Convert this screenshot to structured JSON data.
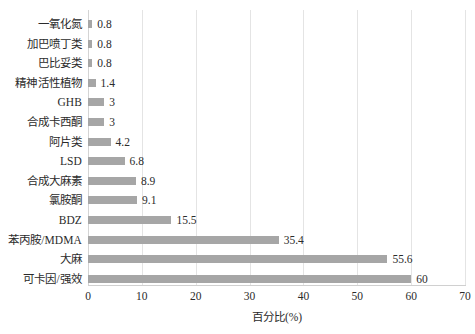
{
  "chart_data": {
    "type": "bar",
    "orientation": "horizontal",
    "title": "",
    "xlabel": "百分比(%)",
    "ylabel": "",
    "xlim": [
      0,
      70
    ],
    "xticks": [
      "0",
      "10",
      "20",
      "30",
      "40",
      "50",
      "60",
      "70"
    ],
    "grid": "vertical",
    "legend": "none",
    "bar_color": "#a6a6a6",
    "categories": [
      "一氧化氮",
      "加巴喷丁类",
      "巴比妥类",
      "精神活性植物",
      "GHB",
      "合成卡西酮",
      "阿片类",
      "LSD",
      "合成大麻素",
      "氯胺酮",
      "BDZ",
      "苯丙胺/MDMA",
      "大麻",
      "可卡因/强效"
    ],
    "values": [
      0.8,
      0.8,
      0.8,
      1.4,
      3,
      3,
      4.2,
      6.8,
      8.9,
      9.1,
      15.5,
      35.4,
      55.6,
      60
    ],
    "value_labels": [
      "0.8",
      "0.8",
      "0.8",
      "1.4",
      "3",
      "3",
      "4.2",
      "6.8",
      "8.9",
      "9.1",
      "15.5",
      "35.4",
      "55.6",
      "60"
    ]
  }
}
